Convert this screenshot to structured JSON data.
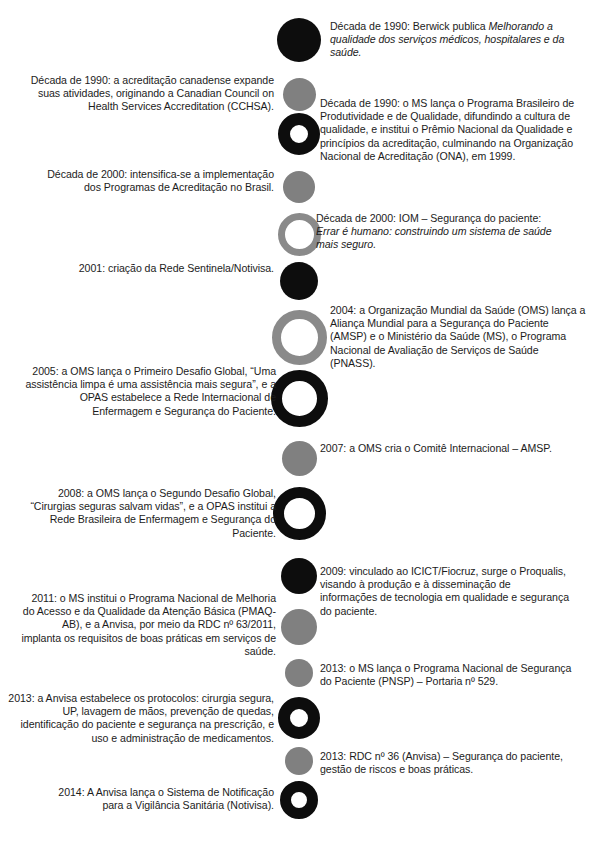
{
  "figure": {
    "kind": "timeline-infographic",
    "language": "pt-BR",
    "colors": {
      "solid_black": "#0d0d0d",
      "solid_gray": "#808080",
      "ring_black": "#0d0d0d",
      "ring_gray": "#8a8a8a",
      "background": "#ffffff",
      "text": "#1c1c1c"
    }
  },
  "events": [
    {
      "id": "e1",
      "side": "right",
      "marker": "solid-black",
      "year": "Década de 1990",
      "text_plain": "Década de 1990: Berwick publica Melhorando a qualidade dos serviços médicos, hospitalares e da saúde.",
      "lead": "Década de 1990: Berwick publica ",
      "italic": "Melhorando a qualidade dos serviços médicos, hospitalares e da saúde.",
      "tail": ""
    },
    {
      "id": "e2",
      "side": "left",
      "marker": "solid-gray",
      "year": "Década de 1990",
      "text_plain": "Década de 1990: a acreditação canadense expande suas atividades, originando a Canadian Council on Health Services Accreditation (CCHSA).",
      "lead": "Década de 1990: a acreditação canadense expande suas atividades, originando a Canadian Council on Health Services Accreditation (CCHSA).",
      "italic": "",
      "tail": ""
    },
    {
      "id": "e3",
      "side": "right",
      "marker": "ring-black",
      "year": "Década de 1990",
      "text_plain": "Década de 1990: o MS lança o Programa Brasileiro de Produtividade e de Qualidade, difundindo a cultura de qualidade, e institui o Prêmio Nacional da Qualidade e princípios da acreditação, culminando na Organização Nacional de Acreditação (ONA), em 1999.",
      "lead": "Década de 1990: o MS lança o Programa Brasileiro de Produtividade e de Qualidade, difundindo a cultura de qualidade, e institui o Prêmio Nacional da Qualidade e princípios da acreditação, culminando na Organização Nacional de Acreditação (ONA), em 1999.",
      "italic": "",
      "tail": ""
    },
    {
      "id": "e4",
      "side": "left",
      "marker": "solid-gray",
      "year": "Década de 2000",
      "text_plain": "Década de 2000: intensifica-se a implementação dos Programas de Acreditação no Brasil.",
      "lead": "Década de 2000: intensifica-se a implementação dos Programas de Acreditação no Brasil.",
      "italic": "",
      "tail": ""
    },
    {
      "id": "e5",
      "side": "right",
      "marker": "ring-gray",
      "year": "Década de 2000",
      "text_plain": "Década de 2000: IOM – Segurança do paciente: Errar é humano: construindo um sistema de saúde mais seguro.",
      "lead": "Década de 2000: IOM – Segurança do paciente: ",
      "italic": "Errar é humano: construindo um sistema de saúde mais seguro.",
      "tail": ""
    },
    {
      "id": "e6",
      "side": "left",
      "marker": "solid-black",
      "year": "2001",
      "text_plain": "2001: criação da Rede Sentinela/Notivisa.",
      "lead": "2001: criação da Rede Sentinela/Notivisa.",
      "italic": "",
      "tail": ""
    },
    {
      "id": "e7",
      "side": "right",
      "marker": "ring-gray",
      "year": "2004",
      "text_plain": "2004: a Organização Mundial da Saúde (OMS) lança a Aliança Mundial para a Segurança do Paciente (AMSP) e o Ministério da Saúde (MS), o Programa Nacional de Avaliação de Serviços de Saúde (PNASS).",
      "lead": "2004: a Organização Mundial da Saúde (OMS) lança a Aliança Mundial para a Segurança do Paciente (AMSP) e o Ministério da Saúde (MS), o Programa Nacional de Avaliação de Serviços de Saúde (PNASS).",
      "italic": "",
      "tail": ""
    },
    {
      "id": "e8",
      "side": "left",
      "marker": "ring-black",
      "year": "2005",
      "text_plain": "2005: a OMS lança o Primeiro Desafio Global, “Uma assistência limpa é uma assistência mais segura”, e a OPAS estabelece a Rede Internacional de Enfermagem e Segurança do Paciente.",
      "lead": "2005: a OMS lança o Primeiro Desafio Global, “Uma assistência limpa é uma assistência mais segura”, e a OPAS estabelece a Rede Internacional de Enfermagem e Segurança do Paciente.",
      "italic": "",
      "tail": ""
    },
    {
      "id": "e9",
      "side": "right",
      "marker": "solid-gray",
      "year": "2007",
      "text_plain": "2007: a OMS cria o Comitê Internacional – AMSP.",
      "lead": "2007: a OMS cria o Comitê Internacional – AMSP.",
      "italic": "",
      "tail": ""
    },
    {
      "id": "e10",
      "side": "left",
      "marker": "ring-black",
      "year": "2008",
      "text_plain": "2008: a OMS lança o Segundo Desafio Global, “Cirurgias seguras salvam vidas”, e a OPAS institui a Rede Brasileira de Enfermagem e Segurança do Paciente.",
      "lead": "2008: a OMS lança o Segundo Desafio Global, “Cirurgias seguras salvam vidas”, e a OPAS institui a Rede Brasileira de Enfermagem e Segurança do Paciente.",
      "italic": "",
      "tail": ""
    },
    {
      "id": "e11",
      "side": "right",
      "marker": "solid-black",
      "year": "2009",
      "text_plain": "2009: vinculado ao ICICT/Fiocruz, surge o Proqualis, visando à produção e à disseminação de informações de tecnologia em qualidade e segurança do paciente.",
      "lead": "2009: vinculado ao ICICT/Fiocruz, surge o Proqualis, visando à produção e à disseminação de informações de tecnologia em qualidade e segurança do paciente.",
      "italic": "",
      "tail": ""
    },
    {
      "id": "e12",
      "side": "left",
      "marker": "solid-gray",
      "year": "2011",
      "text_plain": "2011: o MS institui o Programa Nacional de Melhoria do Acesso e da Qualidade da Atenção Básica (PMAQ-AB), e a Anvisa, por meio da RDC nº 63/2011, implanta os requisitos de boas práticas em serviços de saúde.",
      "lead": "2011: o MS institui o Programa Nacional de Melhoria do Acesso e da Qualidade da Atenção Básica (PMAQ-AB), e a Anvisa, por meio da RDC nº 63/2011, implanta os requisitos de boas práticas em serviços de saúde.",
      "italic": "",
      "tail": ""
    },
    {
      "id": "e13",
      "side": "right",
      "marker": "solid-gray",
      "year": "2013",
      "text_plain": "2013: o MS lança o Programa Nacional de Segurança do Paciente (PNSP) – Portaria nº 529.",
      "lead": "2013: o MS lança o Programa Nacional de Segurança do Paciente (PNSP) – Portaria nº 529.",
      "italic": "",
      "tail": ""
    },
    {
      "id": "e14",
      "side": "left",
      "marker": "ring-black",
      "year": "2013",
      "text_plain": "2013: a Anvisa estabelece os protocolos: cirurgia segura, UP, lavagem de mãos, prevenção de quedas, identificação do paciente e segurança na prescrição, e uso e administração de medicamentos.",
      "lead": "2013: a Anvisa estabelece os protocolos: cirurgia segura, UP, lavagem de mãos, prevenção de quedas, identificação do paciente e segurança na prescrição, e uso e administração de medicamentos.",
      "italic": "",
      "tail": ""
    },
    {
      "id": "e15",
      "side": "right",
      "marker": "solid-gray",
      "year": "2013",
      "text_plain": "2013: RDC nº 36 (Anvisa) – Segurança do paciente, gestão de riscos e boas práticas.",
      "lead": "2013: RDC nº 36 (Anvisa) – Segurança do paciente, gestão de riscos e boas práticas.",
      "italic": "",
      "tail": ""
    },
    {
      "id": "e16",
      "side": "left",
      "marker": "ring-black",
      "year": "2014",
      "text_plain": "2014: A Anvisa lança o Sistema de Notificação para a Vigilância Sanitária (Notivisa).",
      "lead": "2014: A Anvisa lança o Sistema de Notificação para a Vigilância Sanitária (Notivisa).",
      "italic": "",
      "tail": ""
    }
  ]
}
